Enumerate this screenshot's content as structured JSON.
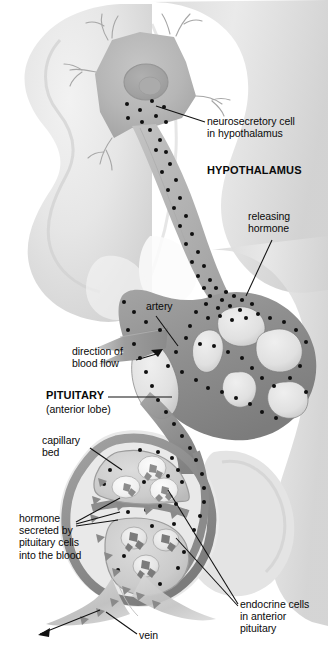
{
  "figure": {
    "width": 328,
    "height": 651,
    "background_color": "#ffffff"
  },
  "palette": {
    "brain_silhouette": "#e6e6e6",
    "brain_silhouette_dark": "#d2d2d2",
    "neuron_body": "#b9b9b9",
    "neuron_nucleus": "#a8a8a8",
    "axon": "#b4b4b4",
    "vessel_wall": "#8f8f8f",
    "vessel_lumen": "#cfcfcf",
    "artery": "#9a9a9a",
    "vein": "#c8c8c8",
    "granule": "#111111",
    "endocrine_cell": "#8a8a8a",
    "leader_line": "#111111",
    "text": "#0a0a0a"
  },
  "labels": [
    {
      "name": "neurosecretory-cell-label",
      "text": "neurosecretory cell\nin hypothalamus",
      "x": 207,
      "y": 115,
      "align": "left",
      "bold": false
    },
    {
      "name": "hypothalamus-label",
      "text": "HYPOTHALAMUS",
      "x": 207,
      "y": 164,
      "align": "left",
      "bold": true
    },
    {
      "name": "releasing-hormone-label",
      "text": "releasing\nhormone",
      "x": 248,
      "y": 210,
      "align": "left",
      "bold": false
    },
    {
      "name": "artery-label",
      "text": "artery",
      "x": 146,
      "y": 300,
      "align": "left",
      "bold": false
    },
    {
      "name": "direction-of-blood-flow-label",
      "text": "direction of\nblood flow",
      "x": 72,
      "y": 345,
      "align": "left",
      "bold": false
    },
    {
      "name": "pituitary-label",
      "text": "PITUITARY",
      "x": 46,
      "y": 389,
      "align": "left",
      "bold": true
    },
    {
      "name": "anterior-lobe-label",
      "text": "(anterior lobe)",
      "x": 46,
      "y": 403,
      "align": "left",
      "bold": false
    },
    {
      "name": "capillary-bed-label",
      "text": "capillary\nbed",
      "x": 42,
      "y": 434,
      "align": "left",
      "bold": false
    },
    {
      "name": "hormone-secreted-label",
      "text": "hormone\nsecreted by\npituitary cells\ninto the blood",
      "x": 19,
      "y": 512,
      "align": "left",
      "bold": false
    },
    {
      "name": "endocrine-cells-label",
      "text": "endocrine cells\nin anterior\npituitary",
      "x": 240,
      "y": 598,
      "align": "left",
      "bold": false
    },
    {
      "name": "vein-label",
      "text": "vein",
      "x": 139,
      "y": 629,
      "align": "left",
      "bold": false
    }
  ],
  "structures": [
    {
      "name": "brain-silhouette",
      "description": "pale gray hypothalamic brain tissue outline filling upper-left and right background"
    },
    {
      "name": "neurosecretory-neuron",
      "description": "star-shaped cell body with nucleus and dendrites at top, axon running down-right"
    },
    {
      "name": "axon",
      "description": "long tapering process carrying dark secretory granules toward the median eminence"
    },
    {
      "name": "secretory-granules",
      "description": "small black dots representing releasing hormone packets"
    },
    {
      "name": "portal-capillary-plexus",
      "description": "looping gray vessel network with open lumina in the median eminence"
    },
    {
      "name": "artery",
      "description": "wedge-shaped inflow vessel entering from the left with flow arrow"
    },
    {
      "name": "capillary-bed",
      "description": "vessel wall enclosing the anterior pituitary lobules"
    },
    {
      "name": "endocrine-cell-lobules",
      "description": "two rounded clusters of hormone-producing cells inside the anterior lobe"
    },
    {
      "name": "vein",
      "description": "outflow vessel leaving the gland at lower left, carrying hormone into circulation"
    }
  ]
}
